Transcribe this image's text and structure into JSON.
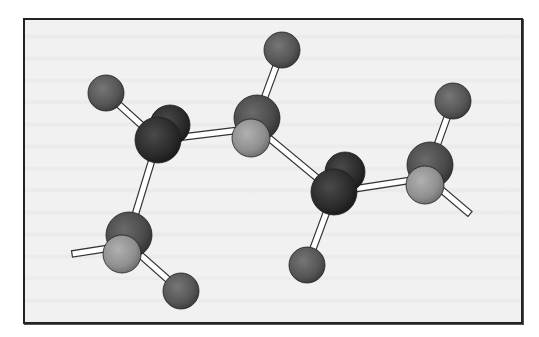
{
  "figure": {
    "type": "ball-and-stick molecular model",
    "frame": {
      "x": 23,
      "y": 18,
      "width": 500,
      "height": 306
    },
    "colors": {
      "background": "#f1f1f1",
      "border": "#222222",
      "bond_fill": "#ffffff",
      "bond_stroke": "#333333",
      "atom_dark": "#2b2b2b",
      "atom_medium": "#4a4a4a",
      "atom_light": "#8f8f8f",
      "atom_hydrogen": "#555555"
    },
    "atoms": [
      {
        "id": "h1",
        "kind": "hydrogen",
        "cx": 106,
        "cy": 93,
        "r": 18,
        "tone": "atom_hydrogen"
      },
      {
        "id": "h2",
        "kind": "hydrogen",
        "cx": 282,
        "cy": 50,
        "r": 18,
        "tone": "atom_hydrogen"
      },
      {
        "id": "h3",
        "kind": "hydrogen",
        "cx": 453,
        "cy": 101,
        "r": 18,
        "tone": "atom_hydrogen"
      },
      {
        "id": "h4",
        "kind": "hydrogen",
        "cx": 307,
        "cy": 265,
        "r": 18,
        "tone": "atom_hydrogen"
      },
      {
        "id": "h5",
        "kind": "hydrogen",
        "cx": 181,
        "cy": 291,
        "r": 18,
        "tone": "atom_hydrogen"
      },
      {
        "id": "c1b",
        "kind": "carbon-back",
        "cx": 170,
        "cy": 125,
        "r": 20,
        "tone": "atom_dark"
      },
      {
        "id": "c1",
        "kind": "carbon",
        "cx": 158,
        "cy": 140,
        "r": 23,
        "tone": "atom_dark"
      },
      {
        "id": "c2b",
        "kind": "carbon-back",
        "cx": 257,
        "cy": 118,
        "r": 23,
        "tone": "atom_medium"
      },
      {
        "id": "c2",
        "kind": "carbon-front",
        "cx": 251,
        "cy": 138,
        "r": 19,
        "tone": "atom_light"
      },
      {
        "id": "c3b",
        "kind": "carbon-back",
        "cx": 345,
        "cy": 172,
        "r": 20,
        "tone": "atom_dark"
      },
      {
        "id": "c3",
        "kind": "carbon",
        "cx": 334,
        "cy": 192,
        "r": 23,
        "tone": "atom_dark"
      },
      {
        "id": "c4b",
        "kind": "carbon-back",
        "cx": 430,
        "cy": 165,
        "r": 23,
        "tone": "atom_medium"
      },
      {
        "id": "c4",
        "kind": "carbon-front",
        "cx": 425,
        "cy": 185,
        "r": 19,
        "tone": "atom_light"
      },
      {
        "id": "c5b",
        "kind": "carbon-back",
        "cx": 129,
        "cy": 235,
        "r": 23,
        "tone": "atom_medium"
      },
      {
        "id": "c5",
        "kind": "carbon-front",
        "cx": 122,
        "cy": 254,
        "r": 19,
        "tone": "atom_light"
      }
    ],
    "bonds": [
      {
        "x1": 106,
        "y1": 93,
        "x2": 158,
        "y2": 140
      },
      {
        "x1": 158,
        "y1": 140,
        "x2": 257,
        "y2": 128
      },
      {
        "x1": 158,
        "y1": 140,
        "x2": 129,
        "y2": 235
      },
      {
        "x1": 282,
        "y1": 50,
        "x2": 257,
        "y2": 118
      },
      {
        "x1": 257,
        "y1": 128,
        "x2": 334,
        "y2": 192
      },
      {
        "x1": 334,
        "y1": 192,
        "x2": 425,
        "y2": 178
      },
      {
        "x1": 334,
        "y1": 192,
        "x2": 307,
        "y2": 265
      },
      {
        "x1": 453,
        "y1": 101,
        "x2": 430,
        "y2": 165
      },
      {
        "x1": 430,
        "y1": 180,
        "x2": 470,
        "y2": 214
      },
      {
        "x1": 129,
        "y1": 245,
        "x2": 181,
        "y2": 291
      },
      {
        "x1": 129,
        "y1": 245,
        "x2": 72,
        "y2": 254
      }
    ]
  }
}
